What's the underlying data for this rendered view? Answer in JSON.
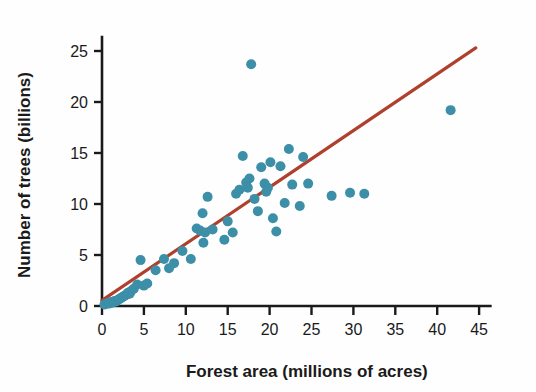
{
  "chart_data": {
    "type": "scatter",
    "title": "",
    "xlabel": "Forest area (millions of acres)",
    "ylabel": "Number of trees (billions)",
    "xlim": [
      0,
      46.5
    ],
    "ylim": [
      0,
      26.5
    ],
    "xticks": [
      0,
      5,
      10,
      15,
      20,
      25,
      30,
      35,
      40,
      45
    ],
    "yticks": [
      0,
      5,
      10,
      15,
      20,
      25
    ],
    "grid": false,
    "legend": "none",
    "point_color": "#3d8fa8",
    "point_radius": 5.0,
    "line_color": "#b0402e",
    "axis_color": "#1a1a1a",
    "series": [
      {
        "name": "States",
        "points": [
          [
            0.3,
            0.15
          ],
          [
            0.5,
            0.2
          ],
          [
            0.7,
            0.3
          ],
          [
            0.9,
            0.25
          ],
          [
            1.1,
            0.4
          ],
          [
            1.3,
            0.35
          ],
          [
            1.5,
            0.5
          ],
          [
            1.7,
            0.45
          ],
          [
            1.9,
            0.6
          ],
          [
            2.1,
            0.7
          ],
          [
            2.3,
            0.8
          ],
          [
            2.5,
            0.9
          ],
          [
            2.7,
            1.0
          ],
          [
            2.9,
            1.1
          ],
          [
            3.1,
            1.3
          ],
          [
            3.3,
            1.2
          ],
          [
            3.5,
            1.5
          ],
          [
            3.8,
            1.7
          ],
          [
            4.2,
            2.1
          ],
          [
            4.6,
            4.5
          ],
          [
            5.0,
            2.0
          ],
          [
            5.4,
            2.2
          ],
          [
            6.4,
            3.5
          ],
          [
            7.4,
            4.6
          ],
          [
            8.0,
            3.7
          ],
          [
            8.6,
            4.2
          ],
          [
            9.6,
            5.4
          ],
          [
            10.6,
            4.6
          ],
          [
            11.3,
            7.6
          ],
          [
            11.7,
            7.4
          ],
          [
            12.0,
            9.1
          ],
          [
            12.1,
            6.2
          ],
          [
            12.3,
            7.2
          ],
          [
            12.6,
            10.7
          ],
          [
            13.2,
            7.5
          ],
          [
            14.6,
            6.5
          ],
          [
            15.0,
            8.3
          ],
          [
            15.6,
            7.2
          ],
          [
            16.0,
            11.0
          ],
          [
            16.4,
            11.4
          ],
          [
            16.8,
            14.7
          ],
          [
            17.2,
            12.1
          ],
          [
            17.4,
            11.6
          ],
          [
            17.6,
            12.5
          ],
          [
            17.8,
            23.7
          ],
          [
            18.2,
            10.5
          ],
          [
            18.6,
            9.3
          ],
          [
            19.0,
            13.6
          ],
          [
            19.4,
            12.0
          ],
          [
            19.6,
            11.2
          ],
          [
            19.8,
            11.6
          ],
          [
            20.1,
            14.1
          ],
          [
            20.4,
            8.6
          ],
          [
            20.8,
            7.3
          ],
          [
            21.3,
            13.7
          ],
          [
            21.8,
            10.1
          ],
          [
            22.3,
            15.4
          ],
          [
            22.7,
            11.9
          ],
          [
            23.6,
            9.8
          ],
          [
            24.0,
            14.6
          ],
          [
            24.6,
            12.0
          ],
          [
            27.4,
            10.8
          ],
          [
            29.6,
            11.1
          ],
          [
            31.3,
            11.0
          ],
          [
            41.6,
            19.2
          ]
        ]
      }
    ],
    "trendline": {
      "name": "Least-squares regression line",
      "x_start": 0.0,
      "y_start": 0.55,
      "x_end": 44.6,
      "y_end": 25.3
    }
  }
}
